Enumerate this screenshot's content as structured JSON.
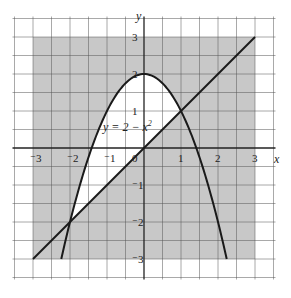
{
  "figure": {
    "axes": {
      "x_label": "x",
      "y_label": "y",
      "x_ticks": [
        {
          "value": -3,
          "label": "⁻3"
        },
        {
          "value": -2,
          "label": "⁻2"
        },
        {
          "value": -1,
          "label": "⁻1"
        },
        {
          "value": 0,
          "label": "0"
        },
        {
          "value": 1,
          "label": "1"
        },
        {
          "value": 2,
          "label": "2"
        },
        {
          "value": 3,
          "label": "3"
        }
      ],
      "y_ticks": [
        {
          "value": 3,
          "label": "3"
        },
        {
          "value": 2,
          "label": "2"
        },
        {
          "value": 1,
          "label": "1"
        },
        {
          "value": -1,
          "label": "⁻1"
        },
        {
          "value": -2,
          "label": "⁻2"
        },
        {
          "value": -3,
          "label": "⁻3"
        }
      ],
      "grid_range": [
        -3.5,
        3.5
      ],
      "shaded_range": [
        -3,
        3
      ]
    },
    "curve_label": "y = 2 − x²",
    "curve_label_main": "y = 2 − x",
    "curve_label_sup": "2",
    "colors": {
      "background": "#ffffff",
      "shade": "#c8c8c8",
      "grid": "#555555",
      "curve": "#1a1a1a"
    }
  },
  "chart_data": {
    "type": "line",
    "title": "",
    "xlabel": "x",
    "ylabel": "y",
    "xlim": [
      -3.5,
      3.5
    ],
    "ylim": [
      -3.5,
      3.5
    ],
    "grid": true,
    "series": [
      {
        "name": "y = 2 - x^2",
        "kind": "parabola",
        "x_range": [
          -2.236,
          2.236
        ],
        "vertex": [
          0,
          2
        ]
      },
      {
        "name": "y = x",
        "kind": "line",
        "points": [
          [
            -3,
            -3
          ],
          [
            3,
            3
          ]
        ]
      }
    ],
    "intersections": [
      [
        -2,
        -2
      ],
      [
        1,
        1
      ]
    ],
    "shaded_region": "square [-3,3]x[-3,3] shaded except the region bounded between y = x and y = 2 - x^2 (x from -2 to 1)"
  }
}
